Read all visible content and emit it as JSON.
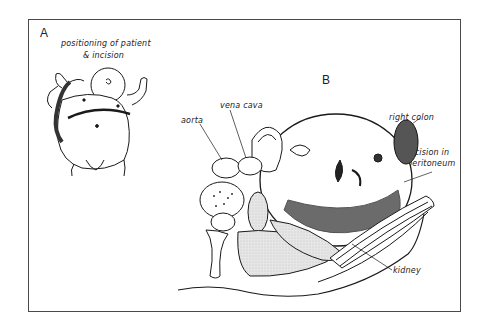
{
  "figure": {
    "panels": [
      {
        "letter": "A",
        "caption_line1": "positioning of patient",
        "caption_line2": "& incision"
      },
      {
        "letter": "B",
        "labels": {
          "aorta": "aorta",
          "vena_cava": "vena cava",
          "tumor": "tumor",
          "right_colon": "right colon",
          "incision_line1": "incision in",
          "incision_line2": "peritoneum",
          "kidney": "kidney"
        }
      }
    ]
  }
}
